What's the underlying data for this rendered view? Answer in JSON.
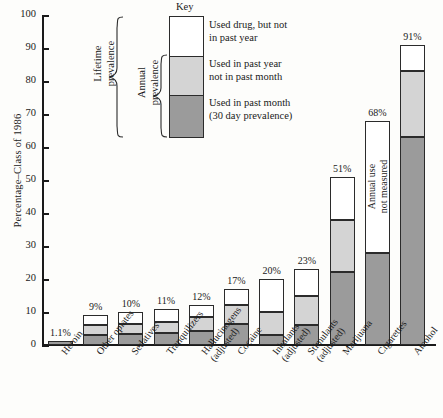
{
  "chart_data": {
    "type": "bar",
    "subtype": "stacked-bar",
    "title": "",
    "xlabel": "",
    "ylabel": "Percentage–Class of 1986",
    "ylim": [
      0,
      100
    ],
    "yticks": [
      0,
      10,
      20,
      30,
      40,
      50,
      60,
      70,
      80,
      90,
      100
    ],
    "grid": false,
    "legend_position": "inside-top-center",
    "categories": [
      "Heroin",
      "Other opiates",
      "Sedatives",
      "Tranquilizers",
      "Hallucinogens\n(adjusted)",
      "Cocaine",
      "Inhalants\n(adjusted)",
      "Stimulants\n(adjusted)",
      "Marijuana",
      "Cigarettes",
      "Alcohol"
    ],
    "series": [
      {
        "name": "Used in past month (30 day prevalence)",
        "key": "past_month",
        "color": "#9b9b9b",
        "values": [
          1.1,
          3.0,
          3.2,
          3.5,
          4.3,
          6.5,
          3.0,
          6.0,
          22.0,
          28.0,
          63.0
        ]
      },
      {
        "name": "Used in past year not in past month",
        "key": "past_year_not_month",
        "color": "#d4d4d4",
        "values": [
          0.0,
          3.0,
          3.3,
          3.5,
          4.2,
          5.5,
          7.0,
          9.0,
          16.0,
          0.0,
          20.0
        ]
      },
      {
        "name": "Used drug, but not in past year",
        "key": "not_past_year",
        "color": "#ffffff",
        "values": [
          0.0,
          3.0,
          3.5,
          4.0,
          3.5,
          5.0,
          10.0,
          8.0,
          13.0,
          40.0,
          8.0
        ]
      }
    ],
    "totals": [
      1.1,
      9,
      10,
      11,
      12,
      17,
      20,
      23,
      51,
      68,
      91
    ],
    "total_labels": [
      "1.1%",
      "9%",
      "10%",
      "11%",
      "12%",
      "17%",
      "20%",
      "23%",
      "51%",
      "68%",
      "91%"
    ],
    "annotations": [
      {
        "name": "cigarettes-annual-not-measured",
        "text": "Annual use\nnot measured",
        "category": "Cigarettes",
        "orientation": "vertical"
      }
    ]
  },
  "legend": {
    "title": "Key",
    "entries": [
      {
        "label": "Used drug, but not\nin past year",
        "line1": "Used drug, but not",
        "line2": "in past year",
        "color": "#ffffff"
      },
      {
        "label": "Used in past year\nnot in past month",
        "line1": "Used in past year",
        "line2": "not in past month",
        "color": "#d4d4d4"
      },
      {
        "label": "Used in past month\n(30 day prevalence)",
        "line1": "Used in past month",
        "line2": "(30 day prevalence)",
        "color": "#9b9b9b"
      }
    ]
  },
  "braces": {
    "lifetime": "Lifetime\nprevalence",
    "lifetime_line1": "Lifetime",
    "lifetime_line2": "prevalence",
    "annual": "Annual\nprevalence",
    "annual_line1": "Annual",
    "annual_line2": "prevalence"
  },
  "axis": {
    "y_title": "Percentage–Class of 1986",
    "y_ticks": [
      "0",
      "10",
      "20",
      "30",
      "40",
      "50",
      "60",
      "70",
      "80",
      "90",
      "100"
    ]
  },
  "colors": {
    "segment_white": "#ffffff",
    "segment_light": "#d4d4d4",
    "segment_dark": "#9b9b9b",
    "stroke": "#2b2b2b",
    "background": "#fdfdfb"
  }
}
